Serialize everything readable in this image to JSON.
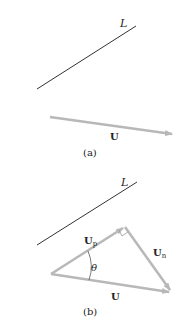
{
  "colors": {
    "line": "#333333",
    "vector": "#b8b8b8",
    "text": "#222222"
  },
  "panel_a": {
    "line_label": "L",
    "vector_label": "U",
    "caption": "(a)"
  },
  "panel_b": {
    "line_label": "L",
    "vector_label": "U",
    "projection_label": "U",
    "projection_sub": "p",
    "normal_label": "U",
    "normal_sub": "n",
    "angle_label": "θ",
    "caption": "(b)"
  }
}
